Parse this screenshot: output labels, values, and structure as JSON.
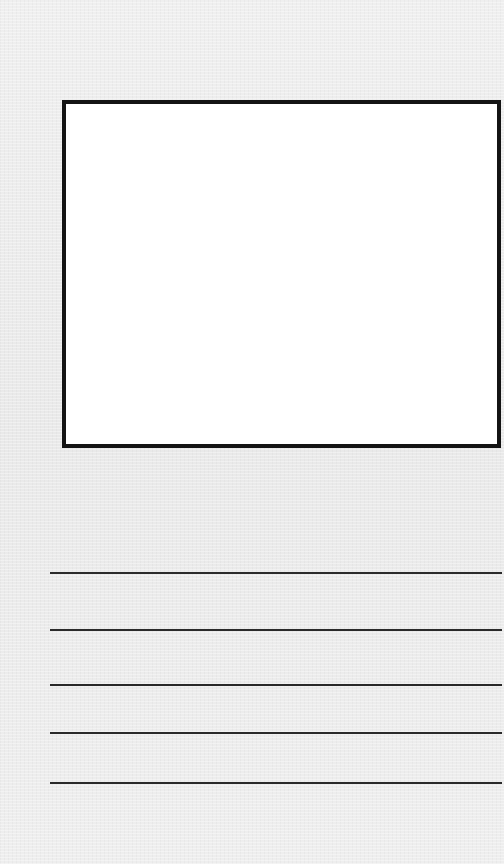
{
  "worksheet": {
    "title": "",
    "drawing_box": {
      "label": "",
      "border_color": "#141414",
      "fill_color": "#ffffff"
    },
    "writing_lines": {
      "count": 5,
      "positions_y": [
        573,
        630,
        685,
        733,
        783
      ],
      "color": "#2a2a2a"
    },
    "background_color": "#ececec"
  }
}
